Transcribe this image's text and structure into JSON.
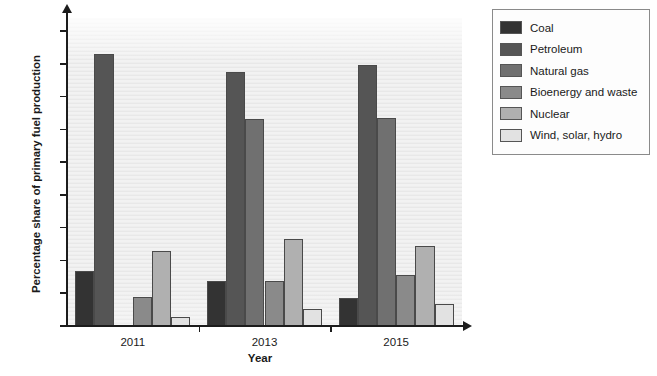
{
  "chart_data": {
    "type": "bar",
    "title": "",
    "xlabel": "Year",
    "ylabel": "Percentage share of primary fuel production",
    "categories": [
      "2011",
      "2013",
      "2015"
    ],
    "ylim": [
      0,
      47
    ],
    "yticks": [
      0,
      5,
      10,
      15,
      20,
      25,
      30,
      35,
      40,
      45
    ],
    "grid": true,
    "legend_position": "right",
    "series": [
      {
        "name": "Coal",
        "color": "#333333",
        "values": [
          8.4,
          6.9,
          4.3
        ]
      },
      {
        "name": "Petroleum",
        "color": "#555555",
        "values": [
          41.5,
          38.7,
          39.9
        ]
      },
      {
        "name": "Natural gas",
        "color": "#707070",
        "values": [
          0,
          31.6,
          31.7
        ]
      },
      {
        "name": "Bioenergy and waste",
        "color": "#8a8a8a",
        "values": [
          4.5,
          6.8,
          7.8
        ]
      },
      {
        "name": "Nuclear",
        "color": "#b0b0b0",
        "values": [
          11.5,
          13.3,
          12.2
        ]
      },
      {
        "name": "Wind, solar, hydro",
        "color": "#e2e2e2",
        "values": [
          1.3,
          2.6,
          3.4
        ]
      }
    ]
  },
  "axis": {
    "y_title": "Percentage share of primary fuel production",
    "x_title": "Year"
  },
  "legend": {
    "items": [
      {
        "label": "Coal"
      },
      {
        "label": "Petroleum"
      },
      {
        "label": "Natural gas"
      },
      {
        "label": "Bioenergy and waste"
      },
      {
        "label": "Nuclear"
      },
      {
        "label": "Wind, solar, hydro"
      }
    ]
  }
}
